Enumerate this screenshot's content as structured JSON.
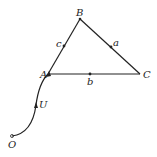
{
  "diagram": {
    "points": {
      "A": {
        "label": "A",
        "x": 48,
        "y": 74
      },
      "B": {
        "label": "B",
        "x": 80,
        "y": 19
      },
      "C": {
        "label": "C",
        "x": 140,
        "y": 74
      },
      "O": {
        "label": "O",
        "x": 12,
        "y": 136
      }
    },
    "edges": {
      "c": {
        "label": "c",
        "from": "A",
        "to": "B"
      },
      "a": {
        "label": "a",
        "from": "B",
        "to": "C"
      },
      "b": {
        "label": "b",
        "from": "A",
        "to": "C"
      }
    },
    "curve": {
      "label": "U",
      "from": "O",
      "to": "A"
    },
    "caption": "",
    "colors": {
      "stroke": "#222222",
      "background": "#ffffff"
    }
  }
}
